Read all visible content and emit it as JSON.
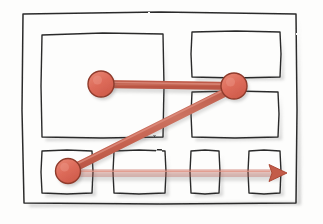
{
  "canvas": {
    "width": 323,
    "height": 224,
    "background": "#fdfdfc",
    "title": "Hand-drawn sketch of nested rectangles with connected nodes"
  },
  "style": {
    "ink_color": "#2b2b2b",
    "ink_width": 1.4,
    "shadow_color": "#a9a9a9",
    "node_fill": "#dd6b5a",
    "node_fill_light": "#e88573",
    "node_stroke": "#8f3b2c",
    "connector_color": "#c8604f",
    "connector_core": "#d97a68",
    "connector_width": 7,
    "paper_color": "#fdfdfc"
  },
  "frame": {
    "name": "outer-frame",
    "x": 22,
    "y": 12,
    "width": 274,
    "height": 192,
    "label": ""
  },
  "boxes": [
    {
      "id": "box-top-left",
      "label": "",
      "x": 41,
      "y": 34,
      "width": 122,
      "height": 103
    },
    {
      "id": "box-top-right",
      "label": "",
      "x": 191,
      "y": 31,
      "width": 89,
      "height": 46
    },
    {
      "id": "box-middle-right",
      "label": "",
      "x": 191,
      "y": 91,
      "width": 87,
      "height": 46
    },
    {
      "id": "box-bottom-1",
      "label": "",
      "x": 41,
      "y": 150,
      "width": 51,
      "height": 43
    },
    {
      "id": "box-bottom-2",
      "label": "",
      "x": 113,
      "y": 150,
      "width": 52,
      "height": 43
    },
    {
      "id": "box-bottom-3",
      "label": "",
      "x": 190,
      "y": 150,
      "width": 29,
      "height": 43
    },
    {
      "id": "box-bottom-4",
      "label": "",
      "x": 248,
      "y": 150,
      "width": 32,
      "height": 43
    }
  ],
  "nodes": [
    {
      "id": "node-left",
      "label": "",
      "cx": 101,
      "cy": 84,
      "r": 13
    },
    {
      "id": "node-hub",
      "label": "",
      "cx": 234,
      "cy": 86,
      "r": 13
    },
    {
      "id": "node-bottom-left",
      "label": "",
      "cx": 68,
      "cy": 171,
      "r": 12.5
    }
  ],
  "connectors": [
    {
      "id": "connector-left-to-hub",
      "from": "node-left",
      "to": "node-hub",
      "x1": 101,
      "y1": 84,
      "x2": 234,
      "y2": 86,
      "arrow": false,
      "label": ""
    },
    {
      "id": "connector-hub-to-bottom-left",
      "from": "node-hub",
      "to": "node-bottom-left",
      "x1": 234,
      "y1": 88,
      "x2": 68,
      "y2": 171,
      "arrow": false,
      "label": ""
    },
    {
      "id": "connector-bottom-left-to-right",
      "from": "node-bottom-left",
      "to": "arrow-head-right",
      "x1": 68,
      "y1": 173,
      "x2": 280,
      "y2": 173,
      "arrow": true,
      "label": ""
    }
  ],
  "arrowhead": {
    "id": "arrow-head-right",
    "tip_x": 286,
    "tip_y": 173,
    "size": 15,
    "label": ""
  }
}
